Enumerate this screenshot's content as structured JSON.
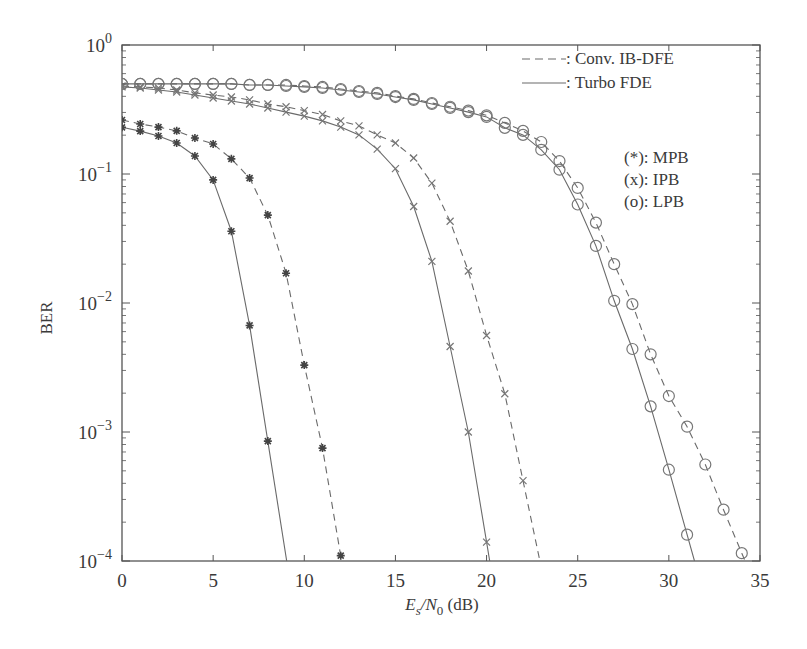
{
  "chart_data": {
    "type": "line",
    "title": "",
    "xlabel": "E_s/N_0 (dB)",
    "ylabel": "BER",
    "xlim": [
      0,
      35
    ],
    "ylim": [
      0.0001,
      1
    ],
    "yscale": "log",
    "x_ticks": [
      0,
      5,
      10,
      15,
      20,
      25,
      30,
      35
    ],
    "y_ticks": [
      "10^0",
      "10^-1",
      "10^-2",
      "10^-3",
      "10^-4"
    ],
    "grid": false,
    "legend": {
      "position": "upper right",
      "line_styles": [
        {
          "style": "dashed",
          "label": ": Conv. IB-DFE"
        },
        {
          "style": "solid",
          "label": ": Turbo FDE"
        }
      ],
      "markers": [
        {
          "marker": "*",
          "label": "(*): MPB"
        },
        {
          "marker": "x",
          "label": "(x): IPB"
        },
        {
          "marker": "o",
          "label": "(o): LPB"
        }
      ]
    },
    "series": [
      {
        "name": "MPB - Turbo FDE",
        "style": "solid",
        "marker": "*",
        "x": [
          0,
          1,
          2,
          3,
          4,
          5,
          6,
          7,
          8
        ],
        "y": [
          0.23,
          0.215,
          0.197,
          0.174,
          0.138,
          0.09,
          0.036,
          0.0067,
          0.00085
        ]
      },
      {
        "name": "MPB - Conv. IB-DFE",
        "style": "dashed",
        "marker": "*",
        "x": [
          0,
          1,
          2,
          3,
          4,
          5,
          6,
          7,
          8,
          9,
          10,
          11,
          12
        ],
        "y": [
          0.262,
          0.244,
          0.231,
          0.216,
          0.19,
          0.171,
          0.131,
          0.093,
          0.048,
          0.017,
          0.0033,
          0.00075,
          0.00011
        ]
      },
      {
        "name": "IPB - Turbo FDE",
        "style": "solid",
        "marker": "x",
        "x": [
          0,
          1,
          2,
          3,
          4,
          5,
          6,
          7,
          8,
          9,
          10,
          11,
          12,
          13,
          14,
          15,
          16,
          17,
          18,
          19,
          20
        ],
        "y": [
          0.473,
          0.464,
          0.448,
          0.432,
          0.41,
          0.388,
          0.368,
          0.349,
          0.325,
          0.302,
          0.281,
          0.258,
          0.231,
          0.201,
          0.156,
          0.11,
          0.056,
          0.021,
          0.0046,
          0.001,
          0.00014
        ]
      },
      {
        "name": "IPB - Conv. IB-DFE",
        "style": "dashed",
        "marker": "x",
        "x": [
          0,
          1,
          2,
          3,
          4,
          5,
          6,
          7,
          8,
          9,
          10,
          11,
          12,
          13,
          14,
          15,
          16,
          17,
          18,
          19,
          20,
          21,
          22
        ],
        "y": [
          0.481,
          0.473,
          0.464,
          0.448,
          0.425,
          0.41,
          0.395,
          0.375,
          0.349,
          0.332,
          0.31,
          0.289,
          0.258,
          0.236,
          0.201,
          0.174,
          0.133,
          0.085,
          0.043,
          0.0177,
          0.0056,
          0.00198,
          0.00042
        ]
      },
      {
        "name": "LPB - Turbo FDE",
        "style": "solid",
        "marker": "o",
        "x": [
          0,
          1,
          2,
          3,
          4,
          5,
          6,
          7,
          8,
          9,
          10,
          11,
          12,
          13,
          14,
          15,
          16,
          17,
          18,
          19,
          20,
          21,
          22,
          23,
          24,
          25,
          26,
          27,
          28,
          29,
          30,
          31
        ],
        "y": [
          0.499,
          0.499,
          0.499,
          0.499,
          0.499,
          0.499,
          0.499,
          0.49,
          0.49,
          0.481,
          0.473,
          0.464,
          0.448,
          0.432,
          0.417,
          0.395,
          0.375,
          0.349,
          0.325,
          0.302,
          0.277,
          0.228,
          0.201,
          0.154,
          0.108,
          0.058,
          0.0277,
          0.0104,
          0.0044,
          0.00158,
          0.00051,
          0.00016
        ]
      },
      {
        "name": "LPB - Conv. IB-DFE",
        "style": "dashed",
        "marker": "o",
        "x": [
          0,
          1,
          2,
          3,
          4,
          5,
          6,
          7,
          8,
          9,
          10,
          11,
          12,
          13,
          14,
          15,
          16,
          17,
          18,
          19,
          20,
          21,
          22,
          23,
          24,
          25,
          26,
          27,
          28,
          29,
          30,
          31,
          32,
          33,
          34
        ],
        "y": [
          0.499,
          0.499,
          0.499,
          0.499,
          0.499,
          0.499,
          0.499,
          0.49,
          0.49,
          0.49,
          0.481,
          0.473,
          0.456,
          0.44,
          0.425,
          0.402,
          0.382,
          0.355,
          0.332,
          0.31,
          0.285,
          0.249,
          0.216,
          0.177,
          0.126,
          0.078,
          0.042,
          0.02,
          0.0098,
          0.004,
          0.0019,
          0.0011,
          0.00056,
          0.00025,
          0.000115
        ]
      }
    ]
  },
  "labels": {
    "ylabel": "BER",
    "xlabel_main": "E",
    "xlabel_sub_s": "s",
    "xlabel_slash": "/N",
    "xlabel_sub_0": "0",
    "xlabel_unit": " (dB)"
  },
  "colors": {
    "axis": "#555555",
    "line": "#6a6a6a",
    "marker_star": "#444444",
    "marker_other": "#777777"
  }
}
